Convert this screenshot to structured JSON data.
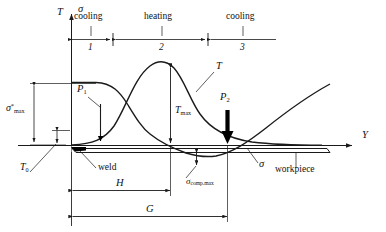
{
  "figure": {
    "type": "technical-diagram",
    "axes": {
      "vertical_left": "T",
      "vertical_left_second": "σ",
      "horizontal": "Y"
    },
    "zones": [
      {
        "number": "1",
        "label": "cooling"
      },
      {
        "number": "2",
        "label": "heating"
      },
      {
        "number": "3",
        "label": "cooling"
      }
    ],
    "curve_labels": {
      "temperature": "T",
      "stress": "σ",
      "temperature_peak": "T",
      "temperature_peak_sub": "max",
      "stress_peak": "σ",
      "stress_peak_sup": "*",
      "stress_peak_sub": "max",
      "stress_comp": "σ",
      "stress_comp_sub": "comp.max",
      "ambient": "T",
      "ambient_sub": "0"
    },
    "point_loads": [
      {
        "name": "P",
        "sub": "1",
        "style": "thin-arrow"
      },
      {
        "name": "P",
        "sub": "2",
        "style": "thick-arrow"
      }
    ],
    "annotations": [
      {
        "name": "weld",
        "text": "weld"
      },
      {
        "name": "workpiece",
        "text": "workpiece"
      }
    ],
    "dimensions": [
      {
        "name": "H",
        "label": "H"
      },
      {
        "name": "G",
        "label": "G"
      }
    ],
    "colors": {
      "line": "#1a1a1a",
      "background": "#ffffff",
      "weld_marker": "#000000"
    }
  }
}
